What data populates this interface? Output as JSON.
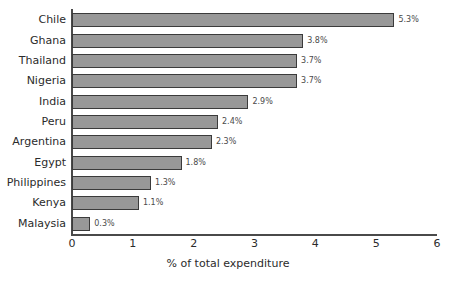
{
  "chart_data": {
    "type": "bar",
    "orientation": "horizontal",
    "title": "",
    "subtitle": "",
    "xlabel": "% of total expenditure",
    "ylabel": "",
    "xlim": [
      0,
      6
    ],
    "xticks": [
      "0",
      "1",
      "2",
      "3",
      "4",
      "5",
      "6"
    ],
    "grid": false,
    "legend": null,
    "categories": [
      "Chile",
      "Ghana",
      "Thailand",
      "Nigeria",
      "India",
      "Peru",
      "Argentina",
      "Egypt",
      "Philippines",
      "Kenya",
      "Malaysia"
    ],
    "values": [
      5.3,
      3.8,
      3.7,
      3.7,
      2.9,
      2.4,
      2.3,
      1.8,
      1.3,
      1.1,
      0.3
    ],
    "data_labels": [
      "5.3%",
      "3.8%",
      "3.7%",
      "3.7%",
      "2.9%",
      "2.4%",
      "2.3%",
      "1.8%",
      "1.3%",
      "1.1%",
      "0.3%"
    ],
    "colors": {
      "bar_fill": "#989898",
      "bar_border": "#3b3b3b",
      "axis": "#4a4a4a",
      "text": "#2b2b2b",
      "label_text": "#4a4a4a",
      "background": "#ffffff"
    }
  }
}
